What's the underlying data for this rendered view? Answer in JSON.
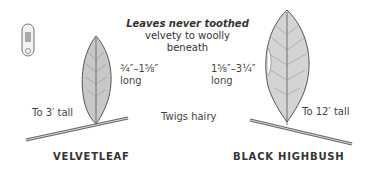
{
  "heading": {
    "title": "Leaves never toothed",
    "line2": "velvety to woolly",
    "line3": "beneath"
  },
  "center_label": "Twigs hairy",
  "plants": [
    {
      "name": "VELVETLEAF",
      "leaf_length": "¾″–1⅝″",
      "leaf_length_unit": "long",
      "height": "To 3′ tall"
    },
    {
      "name": "BLACK HIGHBUSH",
      "leaf_length": "1⅝″–3¼″",
      "leaf_length_unit": "long",
      "height": "To 12′ tall"
    }
  ],
  "icon": "habitat-badge-icon",
  "colors": {
    "leaf_fill": "#cfcfcf",
    "leaf_stroke": "#555555",
    "text": "#3a3a3a"
  }
}
